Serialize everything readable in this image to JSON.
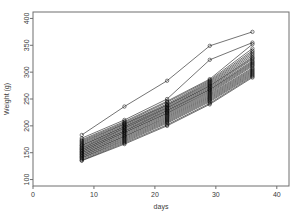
{
  "chart_data": {
    "type": "line",
    "title": "",
    "subtitle": "",
    "xlabel": "days",
    "ylabel": "Weight (g)",
    "xlim": [
      0,
      42
    ],
    "ylim": [
      88,
      412
    ],
    "xticks": [
      0,
      10,
      20,
      30,
      40
    ],
    "xticklabels": [
      "0",
      "10",
      "20",
      "30",
      "40"
    ],
    "yticks": [
      100,
      150,
      200,
      250,
      300,
      350,
      400
    ],
    "yticklabels": [
      "100",
      "150",
      "200",
      "250",
      "300",
      "350",
      "400"
    ],
    "grid": false,
    "legend": "none",
    "marker": "open-circle",
    "line_color": "#000000",
    "x": [
      8,
      15,
      22,
      29,
      36
    ],
    "series": [
      {
        "name": "subject-01",
        "values": [
          183,
          236,
          284,
          349,
          375
        ]
      },
      {
        "name": "subject-02",
        "values": [
          177,
          211,
          250,
          323,
          355
        ]
      },
      {
        "name": "subject-03",
        "values": [
          174,
          208,
          246,
          287,
          352
        ]
      },
      {
        "name": "subject-04",
        "values": [
          172,
          206,
          244,
          285,
          344
        ]
      },
      {
        "name": "subject-05",
        "values": [
          170,
          204,
          241,
          283,
          340
        ]
      },
      {
        "name": "subject-06",
        "values": [
          168,
          203,
          239,
          281,
          337
        ]
      },
      {
        "name": "subject-07",
        "values": [
          166,
          201,
          238,
          279,
          334
        ]
      },
      {
        "name": "subject-08",
        "values": [
          164,
          199,
          236,
          277,
          331
        ]
      },
      {
        "name": "subject-09",
        "values": [
          163,
          198,
          234,
          275,
          328
        ]
      },
      {
        "name": "subject-10",
        "values": [
          161,
          196,
          233,
          274,
          326
        ]
      },
      {
        "name": "subject-11",
        "values": [
          159,
          195,
          231,
          272,
          324
        ]
      },
      {
        "name": "subject-12",
        "values": [
          158,
          193,
          229,
          270,
          321
        ]
      },
      {
        "name": "subject-13",
        "values": [
          156,
          191,
          228,
          268,
          319
        ]
      },
      {
        "name": "subject-14",
        "values": [
          155,
          190,
          226,
          267,
          317
        ]
      },
      {
        "name": "subject-15",
        "values": [
          153,
          188,
          224,
          265,
          315
        ]
      },
      {
        "name": "subject-16",
        "values": [
          152,
          187,
          223,
          263,
          313
        ]
      },
      {
        "name": "subject-17",
        "values": [
          150,
          185,
          221,
          261,
          311
        ]
      },
      {
        "name": "subject-18",
        "values": [
          149,
          183,
          219,
          259,
          308
        ]
      },
      {
        "name": "subject-19",
        "values": [
          147,
          181,
          217,
          257,
          306
        ]
      },
      {
        "name": "subject-20",
        "values": [
          146,
          180,
          215,
          255,
          304
        ]
      },
      {
        "name": "subject-21",
        "values": [
          144,
          178,
          213,
          253,
          302
        ]
      },
      {
        "name": "subject-22",
        "values": [
          143,
          176,
          211,
          251,
          300
        ]
      },
      {
        "name": "subject-23",
        "values": [
          141,
          174,
          209,
          249,
          298
        ]
      },
      {
        "name": "subject-24",
        "values": [
          140,
          172,
          207,
          247,
          296
        ]
      },
      {
        "name": "subject-25",
        "values": [
          138,
          170,
          205,
          245,
          294
        ]
      },
      {
        "name": "subject-26",
        "values": [
          136,
          168,
          202,
          242,
          292
        ]
      },
      {
        "name": "subject-27",
        "values": [
          135,
          166,
          200,
          240,
          290
        ]
      }
    ]
  }
}
